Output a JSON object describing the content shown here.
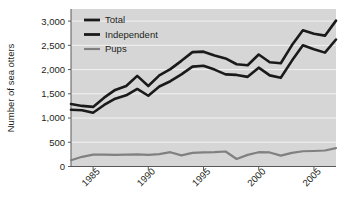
{
  "chart_data": {
    "type": "line",
    "title": "",
    "xlabel": "",
    "ylabel": "Number of sea otters",
    "xlim": [
      1983,
      2007
    ],
    "ylim": [
      0,
      3250
    ],
    "ytick_labels": [
      "0",
      "500",
      "1,000",
      "1,500",
      "2,000",
      "2,500",
      "3,000"
    ],
    "ytick_values": [
      0,
      500,
      1000,
      1500,
      2000,
      2500,
      3000
    ],
    "xtick_labels": [
      "1985",
      "1990",
      "1995",
      "2000",
      "2005"
    ],
    "xtick_values": [
      1985,
      1990,
      1995,
      2000,
      2005
    ],
    "grid": true,
    "grid_color": "#f2f2f2",
    "plot_background": "#d6d6d6",
    "legend_position": "top-left",
    "x": [
      1983,
      1984,
      1985,
      1986,
      1987,
      1988,
      1989,
      1990,
      1991,
      1992,
      1993,
      1994,
      1995,
      1996,
      1997,
      1998,
      1999,
      2000,
      2001,
      2002,
      2003,
      2004,
      2005,
      2006,
      2007
    ],
    "series": [
      {
        "name": "Total",
        "color": "#1a1a1a",
        "values": [
          1290,
          1250,
          1230,
          1420,
          1580,
          1660,
          1870,
          1660,
          1880,
          2010,
          2180,
          2360,
          2370,
          2290,
          2230,
          2110,
          2090,
          2310,
          2150,
          2130,
          2500,
          2810,
          2740,
          2700,
          3010
        ]
      },
      {
        "name": "Independent",
        "color": "#1a1a1a",
        "values": [
          1170,
          1160,
          1110,
          1270,
          1400,
          1470,
          1600,
          1460,
          1650,
          1760,
          1900,
          2060,
          2080,
          2000,
          1900,
          1890,
          1850,
          2040,
          1880,
          1830,
          2180,
          2500,
          2420,
          2350,
          2620
        ]
      },
      {
        "name": "Pups",
        "color": "#808080",
        "values": [
          130,
          200,
          245,
          245,
          240,
          245,
          250,
          240,
          255,
          295,
          230,
          280,
          290,
          295,
          310,
          155,
          240,
          295,
          290,
          225,
          280,
          315,
          320,
          330,
          380
        ]
      }
    ]
  },
  "legend": {
    "items": [
      {
        "label": "Total",
        "color": "#1a1a1a"
      },
      {
        "label": "Independent",
        "color": "#1a1a1a"
      },
      {
        "label": "Pups",
        "color": "#808080"
      }
    ]
  },
  "axes": {
    "y_title": "Number of sea otters"
  }
}
